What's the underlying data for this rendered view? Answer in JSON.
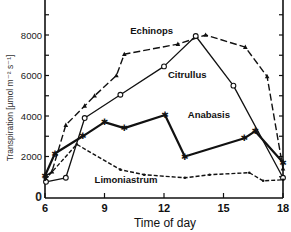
{
  "chart_data": {
    "type": "line",
    "title": "",
    "xlabel": "Time of day",
    "ylabel": "Transpiration [µmol m⁻² s⁻¹]",
    "xlim": [
      6,
      18
    ],
    "ylim": [
      0,
      9500
    ],
    "x_ticks": [
      6,
      9,
      12,
      15,
      18
    ],
    "y_ticks": [
      0,
      2000,
      4000,
      6000,
      8000
    ],
    "y_tick_labels": [
      "0",
      "2000",
      "4000",
      "6000",
      "8000"
    ],
    "grid": false,
    "legend": "inline labels",
    "series": [
      {
        "name": "Echinops",
        "marker": "triangle",
        "line": "long-dash",
        "x": [
          6.0,
          6.35,
          7.05,
          8.0,
          8.5,
          9.6,
          10.0,
          12.7,
          14.1,
          16.1,
          17.2,
          18.0
        ],
        "y": [
          1000,
          1250,
          3550,
          4500,
          5000,
          6000,
          7050,
          7550,
          8000,
          7400,
          5950,
          1400
        ]
      },
      {
        "name": "Citrullus",
        "marker": "circle-open",
        "line": "solid",
        "x": [
          6.05,
          7.05,
          8.0,
          9.8,
          12.0,
          13.6,
          15.5,
          18.0
        ],
        "y": [
          750,
          950,
          3900,
          5050,
          6450,
          7950,
          5500,
          950
        ]
      },
      {
        "name": "Anabasis",
        "marker": "star",
        "line": "thick-solid",
        "x": [
          6.0,
          6.5,
          7.9,
          9.0,
          10.0,
          12.05,
          13.05,
          16.05,
          16.6,
          18.0
        ],
        "y": [
          1050,
          2150,
          3000,
          3700,
          3400,
          4050,
          2000,
          2900,
          3250,
          1700
        ]
      },
      {
        "name": "Limoniastrum",
        "marker": "dot",
        "line": "short-dash",
        "x": [
          6.0,
          7.6,
          9.8,
          11.0,
          13.05,
          14.3,
          16.3,
          17.0,
          18.0
        ],
        "y": [
          850,
          2600,
          1350,
          1100,
          950,
          1100,
          1200,
          800,
          850
        ]
      }
    ],
    "annotations": [
      {
        "text": "Echinops",
        "x": 10.3,
        "y": 8050
      },
      {
        "text": "Citrullus",
        "x": 12.2,
        "y": 5900
      },
      {
        "text": "Anabasis",
        "x": 13.2,
        "y": 3900
      },
      {
        "text": "Limoniastrum",
        "x": 8.5,
        "y": 700
      }
    ]
  },
  "labels": {
    "xlabel": "Time of day",
    "ylabel": "Transpiration [µmol m⁻² s⁻¹]",
    "x_ticks": [
      "6",
      "9",
      "12",
      "15",
      "18"
    ],
    "y_ticks": [
      "0",
      "2000",
      "4000",
      "6000",
      "8000"
    ],
    "series": [
      "Echinops",
      "Citrullus",
      "Anabasis",
      "Limoniastrum"
    ]
  }
}
